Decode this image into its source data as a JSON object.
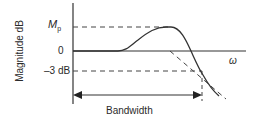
{
  "diagram": {
    "type": "frequency-response",
    "y_axis_label": "Magnitude dB",
    "x_axis_label": "ω",
    "levels": {
      "peak_label_main": "M",
      "peak_label_sub": "p",
      "zero_label": "0",
      "minus3_label": "–3 dB"
    },
    "annotation": {
      "bandwidth_label": "Bandwidth"
    },
    "colors": {
      "line": "#333333",
      "text": "#2a2a2a",
      "background": "#ffffff"
    }
  }
}
